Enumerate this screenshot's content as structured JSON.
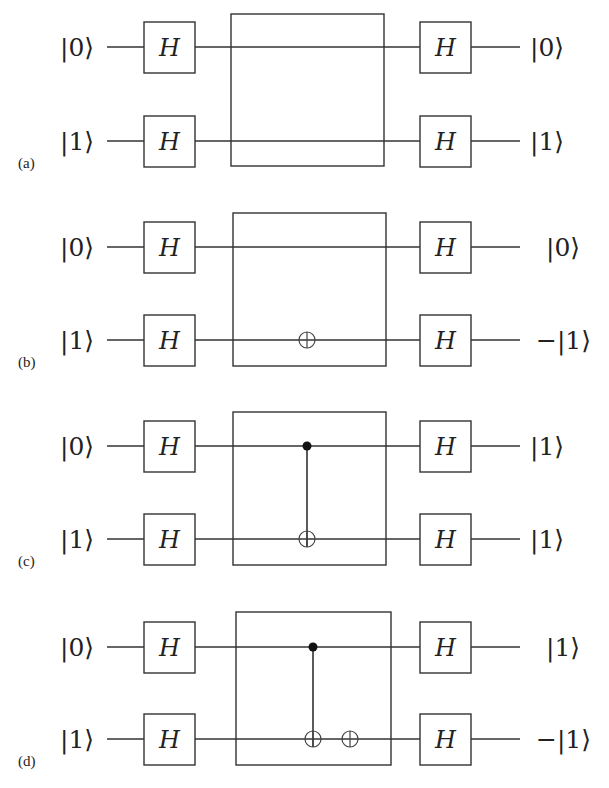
{
  "figure": {
    "gate_label": "H",
    "panels": [
      {
        "label": "(a)",
        "inputs": [
          "|0⟩",
          "|1⟩"
        ],
        "outputs": [
          "|0⟩",
          "|1⟩"
        ],
        "oracle": {
          "controls": [],
          "targets": []
        },
        "y_top": 47,
        "y_bot": 141,
        "box_top": 14,
        "box_bot": 166,
        "box_left": 231,
        "box_right": 384
      },
      {
        "label": "(b)",
        "inputs": [
          "|0⟩",
          "|1⟩"
        ],
        "outputs": [
          "|0⟩",
          "−|1⟩"
        ],
        "oracle": {
          "controls": [],
          "targets": [
            {
              "x": 307
            }
          ]
        },
        "y_top": 247,
        "y_bot": 340,
        "box_top": 213,
        "box_bot": 366,
        "box_left": 233,
        "box_right": 386
      },
      {
        "label": "(c)",
        "inputs": [
          "|0⟩",
          "|1⟩"
        ],
        "outputs": [
          "|1⟩",
          "|1⟩"
        ],
        "oracle": {
          "controls": [
            {
              "x": 307
            }
          ],
          "targets": [
            {
              "x": 307
            }
          ]
        },
        "y_top": 446,
        "y_bot": 539,
        "box_top": 412,
        "box_bot": 565,
        "box_left": 233,
        "box_right": 386
      },
      {
        "label": "(d)",
        "inputs": [
          "|0⟩",
          "|1⟩"
        ],
        "outputs": [
          "|1⟩",
          "−|1⟩"
        ],
        "oracle": {
          "controls": [
            {
              "x": 313
            }
          ],
          "targets": [
            {
              "x": 313
            },
            {
              "x": 350
            }
          ]
        },
        "y_top": 647,
        "y_bot": 739,
        "box_top": 612,
        "box_bot": 765,
        "box_left": 236,
        "box_right": 391
      }
    ]
  }
}
